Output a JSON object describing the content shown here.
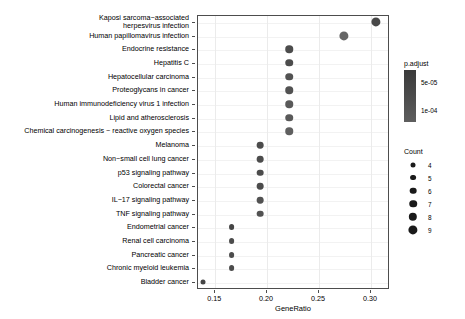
{
  "chart_data": {
    "type": "scatter",
    "title": "",
    "xlabel": "GeneRatio",
    "ylabel": "",
    "xlim": [
      0.1334,
      0.3184
    ],
    "xticks": [
      0.15,
      0.2,
      0.25,
      0.3
    ],
    "xticklabels": [
      "0.15",
      "0.20",
      "0.25",
      "0.30"
    ],
    "grid": true,
    "legend_position": "right",
    "categories": [
      "Kaposi sarcoma-associated herpesvirus infection",
      "Human papillomavirus infection",
      "Endocrine resistance",
      "Hepatitis C",
      "Hepatocellular carcinoma",
      "Proteoglycans in cancer",
      "Human immunodeficiency virus 1 infection",
      "Lipid and atherosclerosis",
      "Chemical carcinogenesis - reactive oxygen species",
      "Melanoma",
      "Non-small cell lung cancer",
      "p53 signaling pathway",
      "Colorectal cancer",
      "IL-17 signaling pathway",
      "TNF signaling pathway",
      "Endometrial cancer",
      "Renal cell carcinoma",
      "Pancreatic cancer",
      "Chronic myeloid leukemia",
      "Bladder cancer"
    ],
    "points": [
      {
        "label": "Kaposi sarcoma-associated herpesvirus infection",
        "gene_ratio": 0.3056,
        "count": 9,
        "p_adjust": 4.5e-05
      },
      {
        "label": "Human papillomavirus infection",
        "gene_ratio": 0.275,
        "count": 9,
        "p_adjust": 9e-05
      },
      {
        "label": "Endocrine resistance",
        "gene_ratio": 0.2222,
        "count": 7,
        "p_adjust": 5e-05
      },
      {
        "label": "Hepatitis C",
        "gene_ratio": 0.2222,
        "count": 7,
        "p_adjust": 5e-05
      },
      {
        "label": "Hepatocellular carcinoma",
        "gene_ratio": 0.2222,
        "count": 7,
        "p_adjust": 6e-05
      },
      {
        "label": "Proteoglycans in cancer",
        "gene_ratio": 0.2222,
        "count": 7,
        "p_adjust": 6e-05
      },
      {
        "label": "Human immunodeficiency virus 1 infection",
        "gene_ratio": 0.2222,
        "count": 7,
        "p_adjust": 7e-05
      },
      {
        "label": "Lipid and atherosclerosis",
        "gene_ratio": 0.2222,
        "count": 7,
        "p_adjust": 7e-05
      },
      {
        "label": "Chemical carcinogenesis - reactive oxygen species",
        "gene_ratio": 0.2222,
        "count": 7,
        "p_adjust": 8e-05
      },
      {
        "label": "Melanoma",
        "gene_ratio": 0.1944,
        "count": 6,
        "p_adjust": 5e-05
      },
      {
        "label": "Non-small cell lung cancer",
        "gene_ratio": 0.1944,
        "count": 6,
        "p_adjust": 5e-05
      },
      {
        "label": "p53 signaling pathway",
        "gene_ratio": 0.1944,
        "count": 6,
        "p_adjust": 5e-05
      },
      {
        "label": "Colorectal cancer",
        "gene_ratio": 0.1944,
        "count": 6,
        "p_adjust": 5e-05
      },
      {
        "label": "IL-17 signaling pathway",
        "gene_ratio": 0.1944,
        "count": 6,
        "p_adjust": 6e-05
      },
      {
        "label": "TNF signaling pathway",
        "gene_ratio": 0.1944,
        "count": 6,
        "p_adjust": 6e-05
      },
      {
        "label": "Endometrial cancer",
        "gene_ratio": 0.1667,
        "count": 5,
        "p_adjust": 4e-05
      },
      {
        "label": "Renal cell carcinoma",
        "gene_ratio": 0.1667,
        "count": 5,
        "p_adjust": 5e-05
      },
      {
        "label": "Pancreatic cancer",
        "gene_ratio": 0.1667,
        "count": 5,
        "p_adjust": 5e-05
      },
      {
        "label": "Chronic myeloid leukemia",
        "gene_ratio": 0.1667,
        "count": 5,
        "p_adjust": 5e-05
      },
      {
        "label": "Bladder cancer",
        "gene_ratio": 0.1389,
        "count": 4,
        "p_adjust": 4e-05
      }
    ],
    "color_legend": {
      "title": "p.adjust",
      "ticks": [
        5e-05,
        0.0001
      ],
      "ticklabels": [
        "5e-05",
        "1e-04"
      ],
      "low_color": "#3b3b3b",
      "high_color": "#5e5e5e"
    },
    "size_legend": {
      "title": "Count",
      "values": [
        4,
        5,
        6,
        7,
        8,
        9
      ]
    }
  }
}
